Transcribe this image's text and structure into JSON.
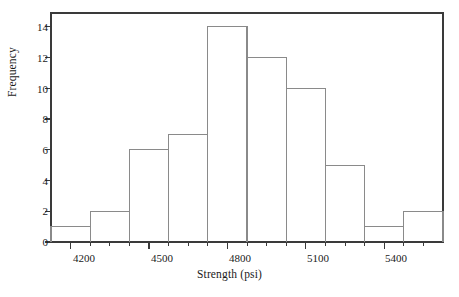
{
  "chart_data": {
    "type": "bar",
    "title": "",
    "subtitle": "",
    "xlabel": "Strength (psi)",
    "ylabel": "Frequency",
    "grid": false,
    "legend": null,
    "legend_position": "none",
    "bar_style": "histogram-outline-no-fill",
    "bin_width": 150,
    "bin_edges": [
      4125,
      4275,
      4425,
      4575,
      4725,
      4875,
      5025,
      5175,
      5325,
      5475,
      5625
    ],
    "bin_centers": [
      4200,
      4350,
      4500,
      4650,
      4800,
      4950,
      5100,
      5250,
      5400,
      5550
    ],
    "categories": [
      "4125-4275",
      "4275-4425",
      "4425-4575",
      "4575-4725",
      "4725-4875",
      "4875-5025",
      "5025-5175",
      "5175-5325",
      "5325-5475",
      "5475-5625"
    ],
    "values": [
      1,
      2,
      6,
      7,
      14,
      12,
      10,
      5,
      1,
      2
    ],
    "total_count": 60,
    "xlim": [
      4125,
      5625
    ],
    "ylim": [
      0,
      14.9
    ],
    "x_tick_labels": [
      "4200",
      "4500",
      "4800",
      "5100",
      "5400"
    ],
    "x_tick_values": [
      4200,
      4500,
      4800,
      5100,
      5400
    ],
    "x_minor_tick_values": [
      4275,
      4350,
      4425,
      4575,
      4650,
      4725,
      4875,
      4950,
      5025,
      5175,
      5250,
      5325,
      5475,
      5550
    ],
    "y_tick_labels": [
      "0",
      "2",
      "4",
      "6",
      "8",
      "10",
      "12",
      "14"
    ],
    "y_tick_values": [
      0,
      2,
      4,
      6,
      8,
      10,
      12,
      14
    ],
    "colors": {
      "axis": "#3a3a3a",
      "bar_outline": "#8a8a8a",
      "bar_fill": "none",
      "text": "#1a1a1a",
      "background": "#ffffff"
    }
  }
}
